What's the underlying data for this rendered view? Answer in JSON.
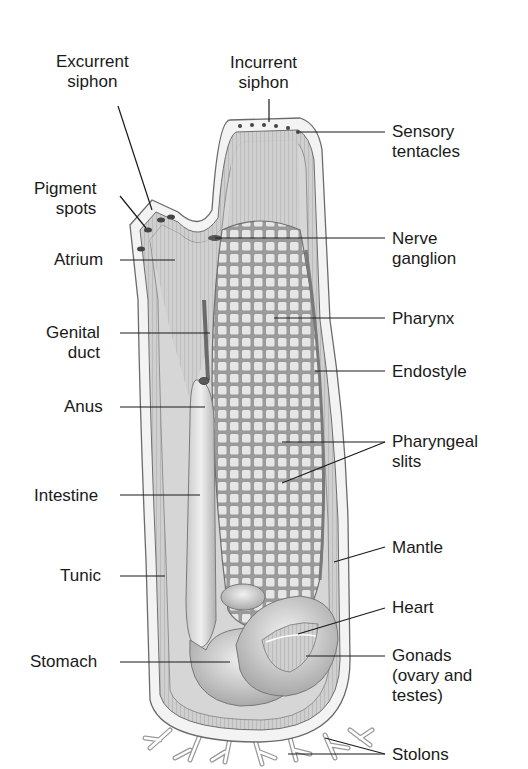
{
  "diagram": {
    "colors": {
      "background": "#ffffff",
      "ink": "#1a1a1a",
      "tunic": "#f2f2f2",
      "mantle": "#b8b8b8",
      "pharynx": "#d9d9d9",
      "organ": "#e4e4e4",
      "shadow": "#8a8a8a"
    },
    "labels": {
      "excurrent_siphon": "Excurrent\nsiphon",
      "incurrent_siphon": "Incurrent\nsiphon",
      "sensory_tentacles": "Sensory\ntentacles",
      "pigment_spots": "Pigment\nspots",
      "atrium": "Atrium",
      "nerve_ganglion": "Nerve\nganglion",
      "pharynx": "Pharynx",
      "genital_duct": "Genital\nduct",
      "endostyle": "Endostyle",
      "anus": "Anus",
      "pharyngeal_slits": "Pharyngeal\nslits",
      "intestine": "Intestine",
      "mantle": "Mantle",
      "tunic": "Tunic",
      "heart": "Heart",
      "stomach": "Stomach",
      "gonads": "Gonads\n(ovary and\ntestes)",
      "stolons": "Stolons"
    }
  }
}
